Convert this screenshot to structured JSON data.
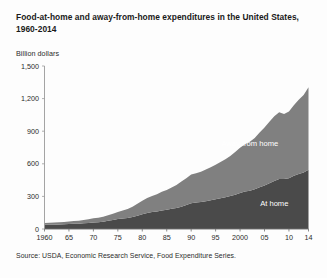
{
  "chart_data": {
    "type": "area",
    "stacked": true,
    "title": "Food-at-home and away-from-home expenditures in the United States, 1960-2014",
    "ylabel": "Billion dollars",
    "xlabel": "",
    "source": "Source: USDA, Economic Research Service, Food Expenditure Series.",
    "ylim": [
      0,
      1500
    ],
    "xlim": [
      1960,
      2014
    ],
    "yticks": [
      0,
      300,
      600,
      900,
      1200,
      1500
    ],
    "ytick_labels": [
      "0",
      "300",
      "600",
      "900",
      "1,200",
      "1,500"
    ],
    "xticks": [
      1960,
      1965,
      1970,
      1975,
      1980,
      1985,
      1990,
      1995,
      2000,
      2005,
      2010,
      2014
    ],
    "xtick_labels": [
      "1960",
      "65",
      "70",
      "75",
      "80",
      "85",
      "90",
      "95",
      "2000",
      "05",
      "10",
      "14"
    ],
    "grid": false,
    "legend_position": "inline-labels",
    "colors": {
      "at_home": "#4a4a4a",
      "away_from_home": "#808080",
      "background": "#fdfdfd",
      "axis": "#9a9a9a",
      "text": "#2b2b2b"
    },
    "x": [
      1960,
      1961,
      1962,
      1963,
      1964,
      1965,
      1966,
      1967,
      1968,
      1969,
      1970,
      1971,
      1972,
      1973,
      1974,
      1975,
      1976,
      1977,
      1978,
      1979,
      1980,
      1981,
      1982,
      1983,
      1984,
      1985,
      1986,
      1987,
      1988,
      1989,
      1990,
      1991,
      1992,
      1993,
      1994,
      1995,
      1996,
      1997,
      1998,
      1999,
      2000,
      2001,
      2002,
      2003,
      2004,
      2005,
      2006,
      2007,
      2008,
      2009,
      2010,
      2011,
      2012,
      2013,
      2014
    ],
    "series": [
      {
        "name": "At home",
        "label": "At home",
        "color": "#4a4a4a",
        "label_x": 2007,
        "label_y": 215,
        "values": [
          38,
          39,
          40,
          41,
          43,
          45,
          48,
          49,
          52,
          56,
          60,
          63,
          67,
          75,
          83,
          91,
          96,
          101,
          110,
          123,
          136,
          148,
          156,
          162,
          170,
          176,
          186,
          194,
          205,
          220,
          236,
          243,
          248,
          256,
          264,
          273,
          284,
          293,
          303,
          316,
          331,
          344,
          352,
          365,
          385,
          401,
          420,
          441,
          461,
          459,
          467,
          489,
          506,
          521,
          545
        ]
      },
      {
        "name": "Away from home",
        "label": "Away from home",
        "color": "#808080",
        "label_x": 2002,
        "label_y": 760,
        "values": [
          17,
          18,
          19,
          20,
          21,
          23,
          25,
          27,
          30,
          34,
          38,
          41,
          45,
          51,
          58,
          66,
          74,
          82,
          95,
          110,
          124,
          138,
          148,
          158,
          172,
          183,
          196,
          212,
          231,
          247,
          265,
          271,
          279,
          291,
          305,
          319,
          333,
          350,
          368,
          392,
          417,
          437,
          452,
          472,
          503,
          533,
          566,
          597,
          614,
          600,
          614,
          650,
          683,
          712,
          760
        ]
      }
    ],
    "totals_note": {
      "1960": 55,
      "1980": 260,
      "2000": 748,
      "2008": 1075,
      "2009": 1059,
      "2014": 1305
    }
  },
  "annotations": {
    "recession_plateau": "2008-2009 plateau"
  }
}
